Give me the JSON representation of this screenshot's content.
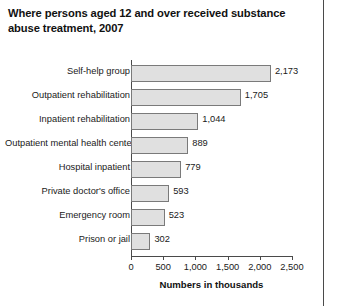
{
  "chart_data": {
    "type": "bar",
    "orientation": "horizontal",
    "title": "Where persons aged 12 and over received substance abuse treatment, 2007",
    "xlabel": "Numbers in thousands",
    "ylabel": "",
    "xlim": [
      0,
      2500
    ],
    "grid": false,
    "legend": null,
    "categories": [
      "Self-help group",
      "Outpatient rehabilitation",
      "Inpatient rehabilitation",
      "Outpatient mental health center",
      "Hospital inpatient",
      "Private doctor's office",
      "Emergency room",
      "Prison or jail"
    ],
    "values": [
      2173,
      1705,
      1044,
      889,
      779,
      593,
      523,
      302
    ],
    "value_labels": [
      "2,173",
      "1,705",
      "1,044",
      "889",
      "779",
      "593",
      "523",
      "302"
    ],
    "xticks": [
      0,
      500,
      1000,
      1500,
      2000,
      2500
    ],
    "xtick_labels": [
      "0",
      "500",
      "1,000",
      "1,500",
      "2,000",
      "2,500"
    ],
    "colors": {
      "bar_fill": "#e0e0e0",
      "bar_border": "#7a7a7a",
      "axis": "#4a4a4a",
      "text": "#1a1a1a",
      "background": "#ffffff"
    }
  }
}
